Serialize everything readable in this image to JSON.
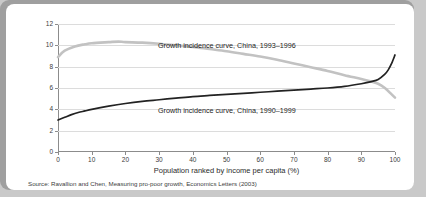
{
  "chart_data": {
    "type": "line",
    "title": "",
    "xlabel": "Population ranked by income per capita (%)",
    "ylabel": "Annual growth in income per capita (%)",
    "xlim": [
      0,
      100
    ],
    "ylim": [
      0,
      12
    ],
    "xticks": [
      0,
      10,
      20,
      30,
      40,
      50,
      60,
      70,
      80,
      90,
      100
    ],
    "yticks": [
      0,
      2,
      4,
      6,
      8,
      10,
      12
    ],
    "grid": "horizontal",
    "legend_position": "inline-annotations",
    "series": [
      {
        "name": "Growth incidence curve, China, 1993–1996",
        "color": "#c2c2c2",
        "x": [
          0,
          2,
          5,
          8,
          10,
          15,
          18,
          20,
          25,
          30,
          35,
          40,
          45,
          50,
          55,
          60,
          65,
          70,
          75,
          80,
          85,
          90,
          93,
          95,
          97,
          99,
          100
        ],
        "values": [
          8.9,
          9.5,
          9.9,
          10.1,
          10.2,
          10.3,
          10.35,
          10.3,
          10.25,
          10.15,
          10.0,
          9.85,
          9.65,
          9.45,
          9.2,
          8.95,
          8.65,
          8.3,
          7.95,
          7.6,
          7.2,
          6.85,
          6.6,
          6.4,
          6.0,
          5.4,
          5.1
        ]
      },
      {
        "name": "Growth incidence curve, China, 1990–1999",
        "color": "#222222",
        "x": [
          0,
          2,
          4,
          6,
          8,
          10,
          15,
          20,
          25,
          30,
          35,
          40,
          45,
          50,
          55,
          60,
          65,
          70,
          75,
          80,
          85,
          90,
          93,
          95,
          97,
          98,
          99,
          100
        ],
        "values": [
          3.0,
          3.25,
          3.5,
          3.7,
          3.85,
          4.0,
          4.3,
          4.55,
          4.75,
          4.9,
          5.05,
          5.2,
          5.3,
          5.4,
          5.5,
          5.6,
          5.7,
          5.8,
          5.9,
          6.0,
          6.15,
          6.4,
          6.6,
          6.8,
          7.3,
          7.7,
          8.3,
          9.1
        ]
      }
    ],
    "annotations": [
      {
        "text": "Growth incidence curve, China, 1993–1996"
      },
      {
        "text": "Growth incidence curve, China, 1990–1999"
      }
    ]
  },
  "axes": {
    "y_title": "Annual growth in income per capita (%)",
    "x_title": "Population ranked by income per capita (%)",
    "y_tick_labels": [
      "12",
      "10",
      "8",
      "6",
      "4",
      "2",
      "0"
    ],
    "x_tick_labels": [
      "0",
      "10",
      "20",
      "30",
      "40",
      "50",
      "60",
      "70",
      "80",
      "90",
      "100"
    ]
  },
  "footer": {
    "source": "Source: Ravallion and Chen, Measuring pro-poor growth, Economics Letters (2003)"
  },
  "colors": {
    "page_background": "#c9c9c9",
    "panel_background": "#ffffff",
    "gridline": "#dcdcdc",
    "axis": "#8c8c8c",
    "series_1993_1996": "#c2c2c2",
    "series_1990_1999": "#222222",
    "text": "#2b2b2b"
  }
}
